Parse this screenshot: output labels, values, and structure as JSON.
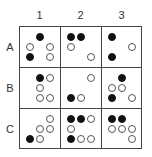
{
  "columns": [
    "1",
    "2",
    "3"
  ],
  "rows": [
    "A",
    "B",
    "C"
  ],
  "legend": {
    "filled": "black-circle",
    "empty": "white-circle"
  },
  "cells": {
    "A1": [
      [
        0,
        1,
        "filled"
      ],
      [
        1,
        0,
        "empty"
      ],
      [
        1,
        2,
        "empty"
      ],
      [
        2,
        0,
        "filled"
      ],
      [
        2,
        2,
        "empty"
      ]
    ],
    "A2": [
      [
        0,
        0,
        "filled"
      ],
      [
        0,
        1,
        "filled"
      ],
      [
        1,
        0,
        "empty"
      ],
      [
        2,
        2,
        "empty"
      ]
    ],
    "A3": [
      [
        0,
        0,
        "filled"
      ],
      [
        1,
        2,
        "empty"
      ],
      [
        2,
        0,
        "filled"
      ]
    ],
    "B1": [
      [
        0,
        1,
        "filled"
      ],
      [
        0,
        2,
        "empty"
      ],
      [
        1,
        1,
        "empty"
      ],
      [
        2,
        1,
        "empty"
      ],
      [
        2,
        2,
        "empty"
      ]
    ],
    "B2": [
      [
        0,
        2,
        "empty"
      ],
      [
        2,
        0,
        "filled"
      ],
      [
        2,
        1,
        "empty"
      ]
    ],
    "B3": [
      [
        0,
        1,
        "filled"
      ],
      [
        1,
        0,
        "empty"
      ],
      [
        1,
        1,
        "empty"
      ],
      [
        2,
        0,
        "filled"
      ],
      [
        2,
        2,
        "empty"
      ]
    ],
    "C1": [
      [
        0,
        2,
        "empty"
      ],
      [
        1,
        1,
        "empty"
      ],
      [
        1,
        2,
        "empty"
      ],
      [
        2,
        0,
        "filled"
      ],
      [
        2,
        1,
        "empty"
      ]
    ],
    "C2": [
      [
        0,
        0,
        "filled"
      ],
      [
        0,
        1,
        "filled"
      ],
      [
        0,
        2,
        "empty"
      ],
      [
        1,
        0,
        "empty"
      ],
      [
        2,
        0,
        "filled"
      ],
      [
        2,
        1,
        "empty"
      ],
      [
        2,
        2,
        "empty"
      ]
    ],
    "C3": [
      [
        0,
        0,
        "filled"
      ],
      [
        0,
        1,
        "filled"
      ],
      [
        1,
        0,
        "empty"
      ],
      [
        1,
        1,
        "empty"
      ],
      [
        1,
        2,
        "empty"
      ],
      [
        2,
        2,
        "empty"
      ]
    ]
  }
}
